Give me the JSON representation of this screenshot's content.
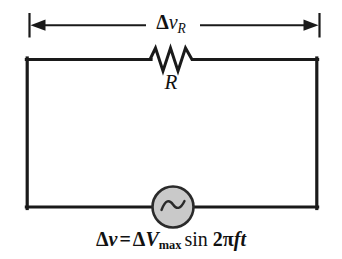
{
  "figure": {
    "background_color": "#ffffff",
    "line_color": "#1a1a1a",
    "source_fill_color": "#c9c9c9"
  },
  "dimension": {
    "name": "voltage-across-resistor",
    "delta_symbol": "Δ",
    "variable": "v",
    "subscript": "R",
    "full_label": "Δv_R"
  },
  "resistor": {
    "label": "R",
    "symbol_name": "resistor-zigzag",
    "peaks": 3
  },
  "source": {
    "symbol_name": "ac-source",
    "glyph": "∿",
    "fill": "#c9c9c9"
  },
  "equation": {
    "lhs_delta": "Δ",
    "lhs_var": "v",
    "equals": "=",
    "rhs_delta": "Δ",
    "rhs_var": "V",
    "rhs_subscript": "max",
    "function": "sin",
    "coefficient": "2",
    "pi": "π",
    "frequency": "f",
    "time": "t",
    "full_text": "Δv = ΔV_max sin 2πft"
  }
}
